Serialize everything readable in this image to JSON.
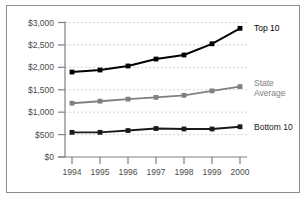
{
  "chart_data": {
    "type": "line",
    "title": "",
    "subtitle": "",
    "xlabel": "",
    "ylabel": "",
    "categories": [
      "1994",
      "1995",
      "1996",
      "1997",
      "1998",
      "1999",
      "2000"
    ],
    "x": [
      1994,
      1995,
      1996,
      1997,
      1998,
      1999,
      2000
    ],
    "ylim": [
      0,
      3000
    ],
    "ytick_values": [
      0,
      500,
      1000,
      1500,
      2000,
      2500,
      3000
    ],
    "ytick_labels": [
      "$0",
      "$500",
      "$1,000",
      "$1,500",
      "$2,000",
      "$2,500",
      "$3,000"
    ],
    "xtick_labels": [
      "1994",
      "1995",
      "1996",
      "1997",
      "1998",
      "1999",
      "2000"
    ],
    "grid": "horizontal-dashed",
    "legend_position": "right-inline-annotations",
    "series": [
      {
        "name": "Top 10",
        "label": "Top 10",
        "color": "#000000",
        "values": [
          1895,
          1940,
          2030,
          2185,
          2275,
          2525,
          2870
        ]
      },
      {
        "name": "State Average",
        "label": "State Average",
        "label_line1": "State",
        "label_line2": "Average",
        "color": "#808080",
        "values": [
          1200,
          1245,
          1290,
          1330,
          1375,
          1475,
          1570
        ]
      },
      {
        "name": "Bottom 10",
        "label": "Bottom 10",
        "color": "#1a1a1a",
        "values": [
          550,
          550,
          590,
          635,
          625,
          625,
          675
        ]
      }
    ]
  },
  "style": {
    "axis_color": "#808080",
    "grid_color": "#c8c8c8",
    "border_color": "#8d8d8d",
    "background": "#ffffff",
    "tick_text_color": "#4c4c4c"
  }
}
